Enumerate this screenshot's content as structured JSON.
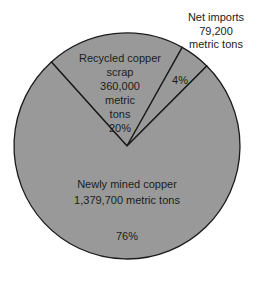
{
  "chart_data": {
    "type": "pie",
    "title": "",
    "fill_color": "#999999",
    "edge_color": "#1a1a1a",
    "slices": [
      {
        "name": "Newly mined copper",
        "value": 1379700,
        "unit": "metric tons",
        "percent": 76,
        "label_lines": [
          "Newly mined copper",
          "1,379,700 metric tons"
        ],
        "percent_label": "76%"
      },
      {
        "name": "Recycled copper scrap",
        "value": 360000,
        "unit": "metric tons",
        "percent": 20,
        "label_lines": [
          "Recycled copper",
          "scrap",
          "360,000",
          "metric",
          "tons"
        ],
        "percent_label": "20%"
      },
      {
        "name": "Net imports",
        "value": 79200,
        "unit": "metric tons",
        "percent": 4,
        "label_lines": [
          "Net imports",
          "79,200",
          "metric tons"
        ],
        "percent_label": "4%"
      }
    ]
  }
}
